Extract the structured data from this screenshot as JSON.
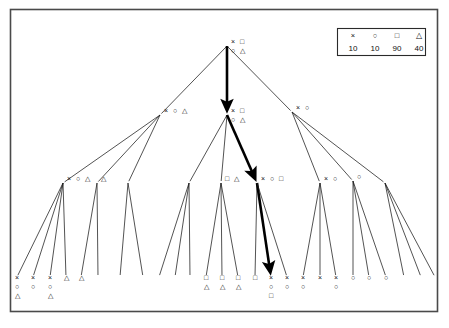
{
  "figure": {
    "title": "",
    "type": "tree-diagram",
    "background_color": "#ffffff",
    "frame_color": "#4a4a4a",
    "edge_color": "#1a1a1a",
    "highlight_color": "#000000"
  },
  "legend": {
    "symbols": [
      "×",
      "○",
      "□",
      "△"
    ],
    "symbol_names": [
      "cross-symbol",
      "circle-symbol",
      "square-symbol",
      "triangle-symbol"
    ],
    "values": [
      "10",
      "10",
      "90",
      "40"
    ]
  },
  "chart_data": {
    "type": "tree",
    "title": "",
    "xlabel": "",
    "ylabel": "",
    "legend": {
      "symbols": [
        "×",
        "○",
        "□",
        "△"
      ],
      "values": [
        10,
        10,
        90,
        40
      ],
      "position": "top-right"
    },
    "levels": 4,
    "highlight_path": [
      "root",
      "L1-1",
      "L2-5",
      "L3-17"
    ],
    "nodes": [
      {
        "id": "root",
        "level": 0,
        "x": 227,
        "y": 44,
        "labels_row1": [
          "×",
          "□"
        ],
        "labels_row2": [
          "○",
          "△"
        ]
      },
      {
        "id": "L1-0",
        "level": 1,
        "x": 160,
        "y": 113,
        "labels_row1": [
          "×",
          "○",
          "△"
        ],
        "labels_row2": []
      },
      {
        "id": "L1-1",
        "level": 1,
        "x": 227,
        "y": 113,
        "labels_row1": [
          "×",
          "□"
        ],
        "labels_row2": [
          "○",
          "△"
        ]
      },
      {
        "id": "L1-2",
        "level": 1,
        "x": 292,
        "y": 110,
        "labels_row1": [
          "×",
          "○"
        ],
        "labels_row2": []
      },
      {
        "id": "L2-0",
        "level": 2,
        "x": 63,
        "y": 181,
        "labels_row1": [
          "×",
          "○",
          "△"
        ],
        "labels_row2": []
      },
      {
        "id": "L2-1",
        "level": 2,
        "x": 97,
        "y": 181,
        "labels_row1": [
          "△"
        ],
        "labels_row2": []
      },
      {
        "id": "L2-2",
        "level": 2,
        "x": 128,
        "y": 181,
        "labels_row1": [],
        "labels_row2": []
      },
      {
        "id": "L2-3",
        "level": 2,
        "x": 189,
        "y": 181,
        "labels_row1": [],
        "labels_row2": []
      },
      {
        "id": "L2-4",
        "level": 2,
        "x": 221,
        "y": 181,
        "labels_row1": [
          "□",
          "△"
        ],
        "labels_row2": []
      },
      {
        "id": "L2-5",
        "level": 2,
        "x": 257,
        "y": 181,
        "labels_row1": [
          "×",
          "○",
          "□"
        ],
        "labels_row2": []
      },
      {
        "id": "L2-6",
        "level": 2,
        "x": 320,
        "y": 181,
        "labels_row1": [
          "×",
          "○"
        ],
        "labels_row2": []
      },
      {
        "id": "L2-7",
        "level": 2,
        "x": 353,
        "y": 179,
        "labels_row1": [
          "○"
        ],
        "labels_row2": []
      },
      {
        "id": "L2-8",
        "level": 2,
        "x": 385,
        "y": 181,
        "labels_row1": [],
        "labels_row2": []
      },
      {
        "id": "L3-0",
        "level": 3,
        "x": 17,
        "y": 275,
        "labels_row1": [
          "×"
        ],
        "labels_row2": [
          "○"
        ],
        "labels_row3": [
          "△"
        ]
      },
      {
        "id": "L3-1",
        "level": 3,
        "x": 33,
        "y": 275,
        "labels_row1": [
          "×"
        ],
        "labels_row2": [
          "○"
        ],
        "labels_row3": []
      },
      {
        "id": "L3-2",
        "level": 3,
        "x": 50,
        "y": 275,
        "labels_row1": [
          "×"
        ],
        "labels_row2": [
          "○"
        ],
        "labels_row3": [
          "△"
        ]
      },
      {
        "id": "L3-3",
        "level": 3,
        "x": 66,
        "y": 275,
        "labels_row1": [
          "△"
        ],
        "labels_row2": [],
        "labels_row3": []
      },
      {
        "id": "L3-4",
        "level": 3,
        "x": 81,
        "y": 275,
        "labels_row1": [
          "△"
        ],
        "labels_row2": [],
        "labels_row3": []
      },
      {
        "id": "L3-5",
        "level": 3,
        "x": 98,
        "y": 275,
        "labels_row1": [],
        "labels_row2": [],
        "labels_row3": []
      },
      {
        "id": "L3-6",
        "level": 3,
        "x": 120,
        "y": 275,
        "labels_row1": [],
        "labels_row2": [],
        "labels_row3": []
      },
      {
        "id": "L3-7",
        "level": 3,
        "x": 143,
        "y": 275,
        "labels_row1": [],
        "labels_row2": [],
        "labels_row3": []
      },
      {
        "id": "L3-8",
        "level": 3,
        "x": 159,
        "y": 275,
        "labels_row1": [],
        "labels_row2": [],
        "labels_row3": []
      },
      {
        "id": "L3-9",
        "level": 3,
        "x": 175,
        "y": 275,
        "labels_row1": [],
        "labels_row2": [],
        "labels_row3": []
      },
      {
        "id": "L3-10",
        "level": 3,
        "x": 190,
        "y": 275,
        "labels_row1": [],
        "labels_row2": [],
        "labels_row3": []
      },
      {
        "id": "L3-11",
        "level": 3,
        "x": 206,
        "y": 275,
        "labels_row1": [
          "□"
        ],
        "labels_row2": [
          "△"
        ],
        "labels_row3": []
      },
      {
        "id": "L3-12",
        "level": 3,
        "x": 222,
        "y": 275,
        "labels_row1": [
          "□"
        ],
        "labels_row2": [
          "△"
        ],
        "labels_row3": []
      },
      {
        "id": "L3-13",
        "level": 3,
        "x": 238,
        "y": 275,
        "labels_row1": [
          "□"
        ],
        "labels_row2": [
          "△"
        ],
        "labels_row3": []
      },
      {
        "id": "L3-14",
        "level": 3,
        "x": 255,
        "y": 275,
        "labels_row1": [
          "□"
        ],
        "labels_row2": [],
        "labels_row3": []
      },
      {
        "id": "L3-15",
        "level": 3,
        "x": 271,
        "y": 275,
        "labels_row1": [
          "×"
        ],
        "labels_row2": [
          "○"
        ],
        "labels_row3": [
          "□"
        ]
      },
      {
        "id": "L3-16",
        "level": 3,
        "x": 287,
        "y": 275,
        "labels_row1": [
          "×"
        ],
        "labels_row2": [
          "○"
        ],
        "labels_row3": []
      },
      {
        "id": "L3-17",
        "level": 3,
        "x": 303,
        "y": 275,
        "labels_row1": [
          "×"
        ],
        "labels_row2": [
          "○"
        ],
        "labels_row3": []
      },
      {
        "id": "L3-18",
        "level": 3,
        "x": 320,
        "y": 275,
        "labels_row1": [
          "×"
        ],
        "labels_row2": [],
        "labels_row3": []
      },
      {
        "id": "L3-19",
        "level": 3,
        "x": 336,
        "y": 275,
        "labels_row1": [
          "×"
        ],
        "labels_row2": [
          "○"
        ],
        "labels_row3": []
      },
      {
        "id": "L3-20",
        "level": 3,
        "x": 353,
        "y": 275,
        "labels_row1": [
          "○"
        ],
        "labels_row2": [],
        "labels_row3": []
      },
      {
        "id": "L3-21",
        "level": 3,
        "x": 369,
        "y": 275,
        "labels_row1": [
          "○"
        ],
        "labels_row2": [],
        "labels_row3": []
      },
      {
        "id": "L3-22",
        "level": 3,
        "x": 386,
        "y": 275,
        "labels_row1": [
          "○"
        ],
        "labels_row2": [],
        "labels_row3": []
      },
      {
        "id": "L3-23",
        "level": 3,
        "x": 404,
        "y": 275,
        "labels_row1": [],
        "labels_row2": [],
        "labels_row3": []
      },
      {
        "id": "L3-24",
        "level": 3,
        "x": 421,
        "y": 275,
        "labels_row1": [],
        "labels_row2": [],
        "labels_row3": []
      },
      {
        "id": "L3-25",
        "level": 3,
        "x": 435,
        "y": 275,
        "labels_row1": [],
        "labels_row2": [],
        "labels_row3": []
      }
    ],
    "edges": [
      {
        "from": "root",
        "to": "L1-0",
        "bold": false
      },
      {
        "from": "root",
        "to": "L1-1",
        "bold": true
      },
      {
        "from": "root",
        "to": "L1-2",
        "bold": false
      },
      {
        "from": "L1-0",
        "to": "L2-0",
        "bold": false
      },
      {
        "from": "L1-0",
        "to": "L2-1",
        "bold": false
      },
      {
        "from": "L1-0",
        "to": "L2-2",
        "bold": false
      },
      {
        "from": "L1-1",
        "to": "L2-3",
        "bold": false
      },
      {
        "from": "L1-1",
        "to": "L2-4",
        "bold": false
      },
      {
        "from": "L1-1",
        "to": "L2-5",
        "bold": true
      },
      {
        "from": "L1-2",
        "to": "L2-6",
        "bold": false
      },
      {
        "from": "L1-2",
        "to": "L2-7",
        "bold": false
      },
      {
        "from": "L1-2",
        "to": "L2-8",
        "bold": false
      },
      {
        "from": "L2-0",
        "to": "L3-0",
        "bold": false
      },
      {
        "from": "L2-0",
        "to": "L3-1",
        "bold": false
      },
      {
        "from": "L2-0",
        "to": "L3-2",
        "bold": false
      },
      {
        "from": "L2-0",
        "to": "L3-3",
        "bold": false
      },
      {
        "from": "L2-1",
        "to": "L3-4",
        "bold": false
      },
      {
        "from": "L2-1",
        "to": "L3-5",
        "bold": false
      },
      {
        "from": "L2-2",
        "to": "L3-6",
        "bold": false
      },
      {
        "from": "L2-2",
        "to": "L3-7",
        "bold": false
      },
      {
        "from": "L2-3",
        "to": "L3-8",
        "bold": false
      },
      {
        "from": "L2-3",
        "to": "L3-9",
        "bold": false
      },
      {
        "from": "L2-3",
        "to": "L3-10",
        "bold": false
      },
      {
        "from": "L2-4",
        "to": "L3-11",
        "bold": false
      },
      {
        "from": "L2-4",
        "to": "L3-12",
        "bold": false
      },
      {
        "from": "L2-4",
        "to": "L3-13",
        "bold": false
      },
      {
        "from": "L2-5",
        "to": "L3-14",
        "bold": false
      },
      {
        "from": "L2-5",
        "to": "L3-15",
        "bold": true
      },
      {
        "from": "L2-5",
        "to": "L3-16",
        "bold": false
      },
      {
        "from": "L2-6",
        "to": "L3-17",
        "bold": false
      },
      {
        "from": "L2-6",
        "to": "L3-18",
        "bold": false
      },
      {
        "from": "L2-6",
        "to": "L3-19",
        "bold": false
      },
      {
        "from": "L2-7",
        "to": "L3-20",
        "bold": false
      },
      {
        "from": "L2-7",
        "to": "L3-21",
        "bold": false
      },
      {
        "from": "L2-7",
        "to": "L3-22",
        "bold": false
      },
      {
        "from": "L2-8",
        "to": "L3-23",
        "bold": false
      },
      {
        "from": "L2-8",
        "to": "L3-24",
        "bold": false
      },
      {
        "from": "L2-8",
        "to": "L3-25",
        "bold": false
      }
    ]
  }
}
